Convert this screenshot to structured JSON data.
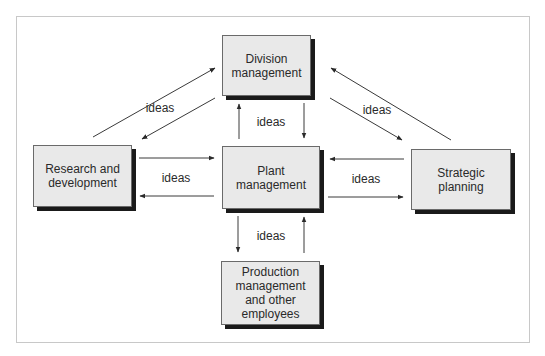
{
  "diagram": {
    "type": "flow",
    "nodes": [
      {
        "id": "division",
        "label": "Division\nmanagement"
      },
      {
        "id": "research",
        "label": "Research and\ndevelopment"
      },
      {
        "id": "plant",
        "label": "Plant\nmanagement"
      },
      {
        "id": "strategic",
        "label": "Strategic\nplanning"
      },
      {
        "id": "production",
        "label": "Production\nmanagement\nand other\nemployees"
      }
    ],
    "edge_labels": {
      "research_division": "ideas",
      "plant_division": "ideas",
      "strategic_division": "ideas",
      "research_plant": "ideas",
      "strategic_plant": "ideas",
      "production_plant": "ideas"
    },
    "edges": [
      {
        "from": "research",
        "to": "division",
        "label": "ideas"
      },
      {
        "from": "division",
        "to": "research",
        "label": "ideas"
      },
      {
        "from": "plant",
        "to": "division",
        "label": "ideas"
      },
      {
        "from": "division",
        "to": "plant",
        "label": "ideas"
      },
      {
        "from": "strategic",
        "to": "division",
        "label": "ideas"
      },
      {
        "from": "division",
        "to": "strategic",
        "label": "ideas"
      },
      {
        "from": "research",
        "to": "plant",
        "label": "ideas"
      },
      {
        "from": "plant",
        "to": "research",
        "label": "ideas"
      },
      {
        "from": "strategic",
        "to": "plant",
        "label": "ideas"
      },
      {
        "from": "plant",
        "to": "strategic",
        "label": "ideas"
      },
      {
        "from": "plant",
        "to": "production",
        "label": "ideas"
      },
      {
        "from": "production",
        "to": "plant",
        "label": "ideas"
      }
    ],
    "colors": {
      "box_fill": "#e9e9e9",
      "shadow": "#1a1a1a",
      "line": "#3a3a3a"
    }
  }
}
